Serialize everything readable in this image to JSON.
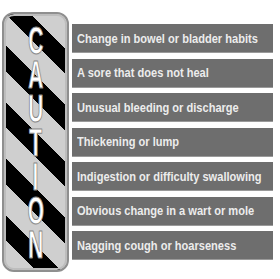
{
  "sign": {
    "word": "CAUTION",
    "letters": [
      "C",
      "A",
      "U",
      "T",
      "I",
      "O",
      "N"
    ],
    "colors": {
      "stripe_dark": "#000000",
      "stripe_light": "#cfcfcf",
      "bar": "#6e6e6e",
      "bar_text": "#ececec"
    }
  },
  "warning_signs": [
    "Change in bowel or bladder habits",
    "A sore that does not heal",
    "Unusual bleeding or discharge",
    "Thickening or lump",
    "Indigestion or difficulty swallowing",
    "Obvious change in a wart or mole",
    "Nagging cough or hoarseness"
  ]
}
